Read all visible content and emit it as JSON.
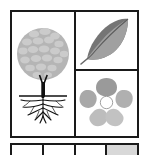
{
  "figure": {
    "background_color": "#ffffff",
    "border_color": "#1a1a1a",
    "panels": [
      {
        "id": "tree",
        "name": "tree-with-roots",
        "label": "Tree with root system",
        "position": "left-column",
        "canopy_color": "#b5b5b5",
        "canopy_highlight_color": "#cccccc",
        "trunk_color": "#111111",
        "root_color": "#111111",
        "ground_line_color": "#111111"
      },
      {
        "id": "leaf",
        "name": "leaf",
        "label": "Leaf with midrib",
        "position": "right-column-top",
        "upper_half_color": "#757575",
        "lower_half_color": "#a0a0a0",
        "midrib_color": "#4a4a4a",
        "stem_color": "#6a6a6a"
      },
      {
        "id": "flower",
        "name": "five-petal-flower",
        "label": "Five petal flower",
        "position": "right-column-bottom",
        "petal_count": 5,
        "petal_colors": [
          "#9a9a9a",
          "#a8a8a8",
          "#bdbdbd",
          "#c2c2c2",
          "#b0b0b0"
        ],
        "center_color": "#ffffff",
        "center_outline_color": "#8a8a8a"
      }
    ]
  },
  "bottom_strip": {
    "name": "legend-strip",
    "cell_count": 4,
    "cells": [
      {
        "label": "",
        "shaded": false
      },
      {
        "label": "",
        "shaded": false
      },
      {
        "label": "",
        "shaded": false
      },
      {
        "label": "",
        "shaded": true
      }
    ],
    "shaded_color": "#d8d8d8"
  }
}
